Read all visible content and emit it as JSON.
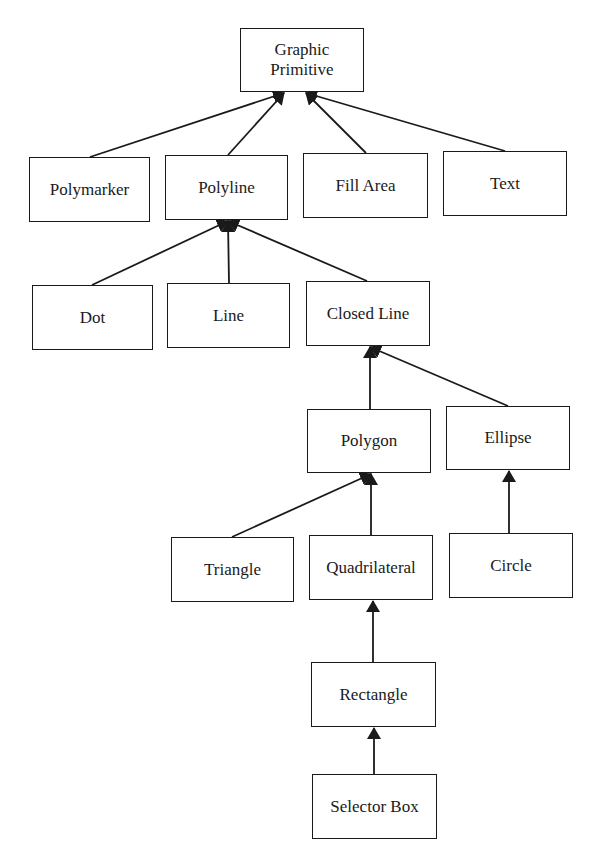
{
  "diagram": {
    "type": "class-hierarchy",
    "colors": {
      "stroke": "#1a1a1a",
      "background": "#ffffff",
      "text": "#1a1a1a"
    },
    "nodes": {
      "graphic_primitive": {
        "label": "Graphic\nPrimitive",
        "x": 240,
        "y": 28,
        "w": 124,
        "h": 64
      },
      "polymarker": {
        "label": "Polymarker",
        "x": 29,
        "y": 157,
        "w": 121,
        "h": 65
      },
      "polyline": {
        "label": "Polyline",
        "x": 165,
        "y": 155,
        "w": 123,
        "h": 65
      },
      "fill_area": {
        "label": "Fill Area",
        "x": 303,
        "y": 153,
        "w": 125,
        "h": 65
      },
      "text": {
        "label": "Text",
        "x": 443,
        "y": 151,
        "w": 124,
        "h": 65
      },
      "dot": {
        "label": "Dot",
        "x": 32,
        "y": 285,
        "w": 121,
        "h": 65
      },
      "line": {
        "label": "Line",
        "x": 167,
        "y": 283,
        "w": 123,
        "h": 65
      },
      "closed_line": {
        "label": "Closed Line",
        "x": 306,
        "y": 281,
        "w": 124,
        "h": 65
      },
      "polygon": {
        "label": "Polygon",
        "x": 307,
        "y": 409,
        "w": 124,
        "h": 64
      },
      "ellipse": {
        "label": "Ellipse",
        "x": 446,
        "y": 406,
        "w": 124,
        "h": 64
      },
      "triangle": {
        "label": "Triangle",
        "x": 171,
        "y": 537,
        "w": 123,
        "h": 65
      },
      "quadrilateral": {
        "label": "Quadrilateral",
        "x": 309,
        "y": 535,
        "w": 124,
        "h": 65
      },
      "circle": {
        "label": "Circle",
        "x": 449,
        "y": 533,
        "w": 124,
        "h": 65
      },
      "rectangle": {
        "label": "Rectangle",
        "x": 311,
        "y": 662,
        "w": 125,
        "h": 65
      },
      "selector_box": {
        "label": "Selector Box",
        "x": 312,
        "y": 774,
        "w": 125,
        "h": 65
      }
    },
    "edges": [
      {
        "from": "polymarker",
        "to": "graphic_primitive",
        "x1": 90,
        "y1": 157,
        "x2": 284,
        "y2": 93
      },
      {
        "from": "polyline",
        "to": "graphic_primitive",
        "x1": 228,
        "y1": 155,
        "x2": 284,
        "y2": 93
      },
      {
        "from": "fill_area",
        "to": "graphic_primitive",
        "x1": 366,
        "y1": 153,
        "x2": 306,
        "y2": 93
      },
      {
        "from": "text",
        "to": "graphic_primitive",
        "x1": 505,
        "y1": 151,
        "x2": 306,
        "y2": 93
      },
      {
        "from": "dot",
        "to": "polyline",
        "x1": 92,
        "y1": 285,
        "x2": 228,
        "y2": 221
      },
      {
        "from": "line",
        "to": "polyline",
        "x1": 229,
        "y1": 283,
        "x2": 228,
        "y2": 221
      },
      {
        "from": "closed_line",
        "to": "polyline",
        "x1": 367,
        "y1": 281,
        "x2": 228,
        "y2": 221
      },
      {
        "from": "polygon",
        "to": "closed_line",
        "x1": 370,
        "y1": 409,
        "x2": 370,
        "y2": 347
      },
      {
        "from": "ellipse",
        "to": "closed_line",
        "x1": 508,
        "y1": 406,
        "x2": 370,
        "y2": 347
      },
      {
        "from": "triangle",
        "to": "polygon",
        "x1": 232,
        "y1": 537,
        "x2": 371,
        "y2": 474
      },
      {
        "from": "quadrilateral",
        "to": "polygon",
        "x1": 371,
        "y1": 535,
        "x2": 371,
        "y2": 474
      },
      {
        "from": "circle",
        "to": "ellipse",
        "x1": 509,
        "y1": 533,
        "x2": 509,
        "y2": 471
      },
      {
        "from": "rectangle",
        "to": "quadrilateral",
        "x1": 373,
        "y1": 662,
        "x2": 373,
        "y2": 601
      },
      {
        "from": "selector_box",
        "to": "rectangle",
        "x1": 374,
        "y1": 774,
        "x2": 374,
        "y2": 728
      }
    ]
  }
}
